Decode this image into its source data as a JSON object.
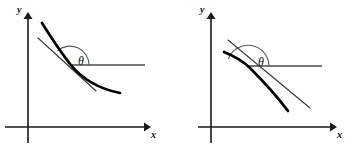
{
  "figure": {
    "background_color": "#ffffff",
    "ink_color": "#000000",
    "width": 356,
    "height": 155
  },
  "panels": [
    {
      "id": "left",
      "caption": "",
      "axis_x_label": "x",
      "axis_y_label": "y",
      "angle_label": "θ",
      "angle_degrees": 145,
      "description": "convex decreasing curve with tangent line at inflected point; obtuse angle theta measured from positive x direction",
      "geometry": {
        "origin": [
          28,
          127
        ],
        "x_axis": {
          "from": [
            5,
            127
          ],
          "to": [
            148,
            127
          ],
          "arrow": true
        },
        "y_axis": {
          "from": [
            28,
            143
          ],
          "to": [
            28,
            14
          ],
          "arrow": true
        },
        "curve_points": [
          [
            42,
            23
          ],
          [
            62,
            48
          ],
          [
            86,
            70
          ],
          [
            104,
            83
          ],
          [
            120,
            92
          ]
        ],
        "tangent_from": [
          38,
          38
        ],
        "tangent_to": [
          96,
          91
        ],
        "tangency_point": [
          70,
          65
        ],
        "ray_from": [
          70,
          65
        ],
        "ray_to": [
          145,
          65
        ],
        "arc_radius": 19,
        "label_xy": [
          82,
          62
        ]
      }
    },
    {
      "id": "right",
      "caption": "",
      "axis_x_label": "x",
      "axis_y_label": "y",
      "angle_label": "θ",
      "angle_degrees": 160,
      "description": "concave decreasing curve falling away below its tangent line; obtuse angle theta measured from positive x direction",
      "geometry": {
        "origin": [
          33,
          127
        ],
        "x_axis": {
          "from": [
            20,
            127
          ],
          "to": [
            159,
            127
          ],
          "arrow": true
        },
        "y_axis": {
          "from": [
            33,
            143
          ],
          "to": [
            33,
            14
          ],
          "arrow": true
        },
        "curve_points": [
          [
            46,
            52
          ],
          [
            62,
            60
          ],
          [
            78,
            71
          ],
          [
            94,
            88
          ],
          [
            110,
            110
          ]
        ],
        "tangent_from": [
          50,
          40
        ],
        "tangent_to": [
          132,
          108
        ],
        "tangency_point": [
          70,
          66
        ],
        "ray_from": [
          70,
          66
        ],
        "ray_to": [
          144,
          66
        ],
        "arc_radius": 21,
        "label_xy": [
          84,
          62
        ]
      }
    }
  ]
}
